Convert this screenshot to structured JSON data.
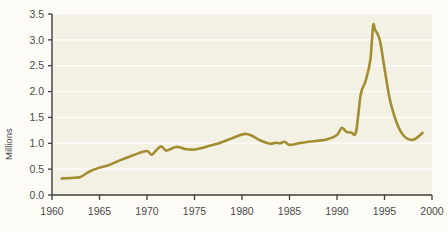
{
  "chart_data": {
    "type": "line",
    "title": "",
    "subtitle": "",
    "xlabel": "",
    "ylabel": "Millions",
    "xlim": [
      1960,
      2000
    ],
    "ylim": [
      0.0,
      3.5
    ],
    "xticks": [
      1960,
      1965,
      1970,
      1975,
      1980,
      1985,
      1990,
      1995,
      2000
    ],
    "xticklabels": [
      "1960",
      "1965",
      "1970",
      "1975",
      "1980",
      "1985",
      "1990",
      "1995",
      "2000"
    ],
    "yticks": [
      0.0,
      0.5,
      1.0,
      1.5,
      2.0,
      2.5,
      3.0,
      3.5
    ],
    "yticklabels": [
      "0.0",
      "0.5",
      "1.0",
      "1.5",
      "2.0",
      "2.5",
      "3.0",
      "3.5"
    ],
    "grid": "horizontal",
    "grid_color": "#ffffff",
    "legend": "none",
    "plot_background": "#f3f0e4",
    "figure_background": "#fdfcf7",
    "axis_color": "#3d3d3d",
    "series": [
      {
        "name": "Millions",
        "color": "#a48c31",
        "line_width": 2.6,
        "x": [
          1961,
          1962,
          1963,
          1964,
          1965,
          1966,
          1967,
          1968,
          1969,
          1970,
          1970.5,
          1971,
          1971.5,
          1972,
          1972.5,
          1973,
          1973.5,
          1974,
          1975,
          1976,
          1977,
          1978,
          1979,
          1980,
          1980.5,
          1981,
          1982,
          1983,
          1983.5,
          1984,
          1984.5,
          1985,
          1986,
          1987,
          1988,
          1989,
          1990,
          1990.5,
          1991,
          1991.5,
          1992,
          1992.5,
          1993,
          1993.5,
          1993.8,
          1994,
          1994.5,
          1995,
          1995.5,
          1996,
          1996.5,
          1997,
          1997.5,
          1998,
          1998.5,
          1999
        ],
        "values": [
          0.32,
          0.33,
          0.35,
          0.46,
          0.53,
          0.58,
          0.66,
          0.73,
          0.8,
          0.85,
          0.78,
          0.87,
          0.94,
          0.86,
          0.89,
          0.93,
          0.92,
          0.89,
          0.88,
          0.92,
          0.97,
          1.03,
          1.1,
          1.17,
          1.18,
          1.15,
          1.05,
          0.99,
          1.01,
          1.0,
          1.03,
          0.97,
          1.0,
          1.03,
          1.05,
          1.08,
          1.16,
          1.3,
          1.22,
          1.21,
          1.22,
          1.95,
          2.2,
          2.6,
          3.27,
          3.2,
          3.0,
          2.45,
          1.9,
          1.55,
          1.3,
          1.15,
          1.08,
          1.07,
          1.12,
          1.2
        ]
      }
    ],
    "annotations": {
      "peak_value": 3.27,
      "peak_year": 1994,
      "start_value": 0.32,
      "start_year": 1961,
      "end_value": 1.2,
      "end_year": 1999
    }
  }
}
